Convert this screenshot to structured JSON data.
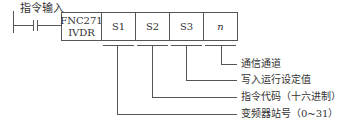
{
  "diagram": {
    "input_label": "指令输入",
    "instruction": {
      "code": "FNC271",
      "mnemonic": "IVDR"
    },
    "operands": [
      "S1",
      "S2",
      "S3",
      "n"
    ],
    "descriptions": {
      "n": "通信通道",
      "S3": "写入运行设定值",
      "S2": "指令代码（十六进制）",
      "S1": "变频器站号（0~31）"
    }
  }
}
